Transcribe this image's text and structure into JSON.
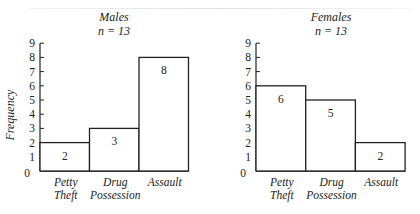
{
  "chart_data": [
    {
      "type": "bar",
      "title": "Males",
      "subtitle": "n = 13",
      "categories": [
        "Petty Theft",
        "Drug Possession",
        "Assault"
      ],
      "category_lines": [
        [
          "Petty",
          "Theft"
        ],
        [
          "Drug",
          "Possession"
        ],
        [
          "Assault"
        ]
      ],
      "values": [
        2,
        3,
        8
      ],
      "xlabel": "",
      "ylabel": "Frequency",
      "ylim": [
        0,
        9
      ],
      "yticks": [
        0,
        1,
        2,
        3,
        4,
        5,
        6,
        7,
        8,
        9
      ],
      "grid": false,
      "legend": null
    },
    {
      "type": "bar",
      "title": "Females",
      "subtitle": "n = 13",
      "categories": [
        "Petty Theft",
        "Drug Possession",
        "Assault"
      ],
      "category_lines": [
        [
          "Petty",
          "Theft"
        ],
        [
          "Drug",
          "Possession"
        ],
        [
          "Assault"
        ]
      ],
      "values": [
        6,
        5,
        2
      ],
      "xlabel": "",
      "ylabel": "",
      "ylim": [
        0,
        9
      ],
      "yticks": [
        0,
        1,
        2,
        3,
        4,
        5,
        6,
        7,
        8,
        9
      ],
      "grid": false,
      "legend": null
    }
  ],
  "colors": {
    "ink": "#222222",
    "bar_fill": "#ffffff",
    "background": "#ffffff"
  }
}
